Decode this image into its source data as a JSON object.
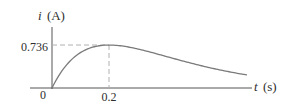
{
  "chart_data": {
    "type": "line",
    "title": "",
    "xlabel": "t (s)",
    "ylabel": "i (A)",
    "xlabel_var": "t",
    "xlabel_unit": "(s)",
    "ylabel_var": "i",
    "ylabel_unit": "(A)",
    "function": "i(t) = 10 t e^(-5t)",
    "x_ticks": [
      {
        "value": 0,
        "label": "0"
      },
      {
        "value": 0.2,
        "label": "0.2"
      }
    ],
    "y_ticks": [
      {
        "value": 0.736,
        "label": "0.736"
      }
    ],
    "annotations": [
      {
        "type": "dashed-guide",
        "x": 0.2,
        "y": 0.736,
        "description": "peak marker"
      }
    ],
    "series": [
      {
        "name": "i(t)",
        "x": [
          0,
          0.05,
          0.1,
          0.15,
          0.2,
          0.25,
          0.3,
          0.35,
          0.4,
          0.45,
          0.5,
          0.55,
          0.6,
          0.65,
          0.684
        ],
        "values": [
          0,
          0.389,
          0.607,
          0.709,
          0.736,
          0.716,
          0.669,
          0.608,
          0.541,
          0.474,
          0.41,
          0.351,
          0.299,
          0.253,
          0.224
        ]
      }
    ],
    "xlim": [
      0,
      0.7
    ],
    "ylim": [
      0,
      1.0
    ],
    "grid": false,
    "legend": null,
    "colors": {
      "curve": "#7a7a7a",
      "axis": "#555555",
      "guide": "#b0b0b0",
      "text": "#2e2e2e"
    }
  }
}
